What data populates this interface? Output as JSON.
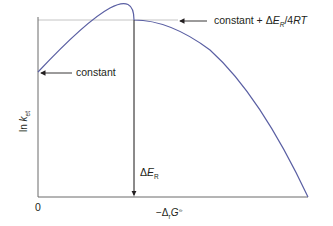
{
  "diagram": {
    "title": "",
    "colors": {
      "curve": "#5a5fa3",
      "axes": "#6b6b6b",
      "guides": "#b5b5b5",
      "arrows": "#231f20",
      "text": "#231f20"
    },
    "axes": {
      "y_label_prefix": "ln ",
      "y_label_var": "k",
      "y_label_sub": "et",
      "x_label_prefix": "−Δ",
      "x_label_sub": "r",
      "x_label_var": "G",
      "x_label_sup": "⦵",
      "origin_label": "0"
    },
    "annotations": {
      "intercept_label": "constant",
      "max_label_prefix": "constant + Δ",
      "max_label_var": "E",
      "max_label_sub": "R",
      "max_label_suffix": "/4",
      "max_label_rt": "RT",
      "delta_prefix": "Δ",
      "delta_var": "E",
      "delta_sub": "R"
    }
  }
}
